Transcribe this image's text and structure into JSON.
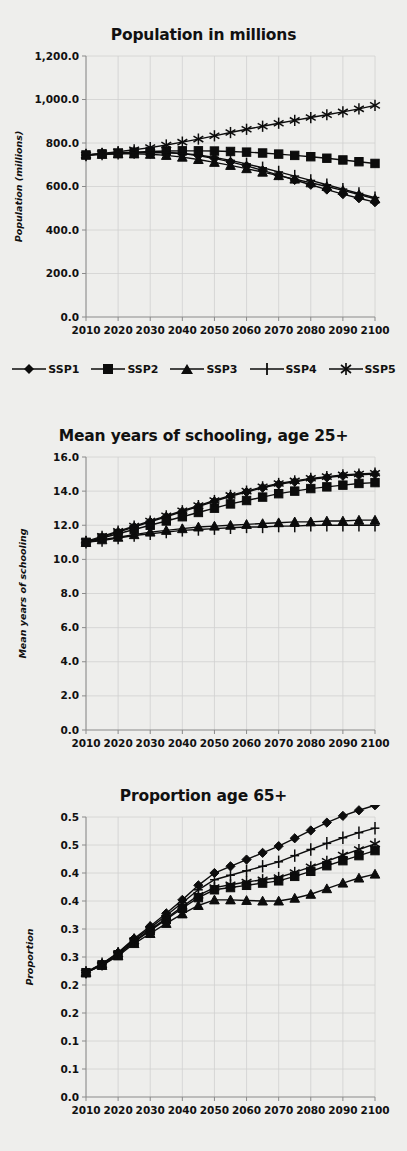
{
  "figure": {
    "panels": [
      "population",
      "schooling",
      "proportion"
    ],
    "legend": {
      "position": "below-first-panel",
      "items": [
        {
          "label": "SSP1",
          "marker": "diamond-marker-icon"
        },
        {
          "label": "SSP2",
          "marker": "square-marker-icon"
        },
        {
          "label": "SSP3",
          "marker": "triangle-marker-icon"
        },
        {
          "label": "SSP4",
          "marker": "plus-marker-icon"
        },
        {
          "label": "SSP5",
          "marker": "asterisk-marker-icon"
        }
      ]
    }
  },
  "chart_data": [
    {
      "id": "population",
      "type": "line",
      "title": "Population in millions",
      "xlabel": "",
      "ylabel": "Population (millions)",
      "grid": true,
      "legend_position": "bottom",
      "xlim": [
        2010,
        2100
      ],
      "ylim": [
        0,
        1200
      ],
      "yticks": [
        0,
        200,
        400,
        600,
        800,
        1000,
        1200
      ],
      "ytick_labels": [
        "0.0",
        "200.0",
        "400.0",
        "600.0",
        "800.0",
        "1,000.0",
        "1,200.0"
      ],
      "xticks": [
        2010,
        2020,
        2030,
        2040,
        2050,
        2060,
        2070,
        2080,
        2090,
        2100
      ],
      "xtick_labels": [
        "2010",
        "2020",
        "2030",
        "2040",
        "2050",
        "2060",
        "2070",
        "2080",
        "2090",
        "2100"
      ],
      "x": [
        2010,
        2015,
        2020,
        2025,
        2030,
        2035,
        2040,
        2045,
        2050,
        2055,
        2060,
        2065,
        2070,
        2075,
        2080,
        2085,
        2090,
        2095,
        2100
      ],
      "series": [
        {
          "name": "SSP1",
          "marker": "diamond",
          "values": [
            745,
            748,
            752,
            755,
            757,
            756,
            751,
            742,
            729,
            713,
            695,
            674,
            652,
            630,
            608,
            586,
            565,
            546,
            528
          ]
        },
        {
          "name": "SSP2",
          "marker": "square",
          "values": [
            745,
            750,
            754,
            758,
            761,
            763,
            764,
            764,
            763,
            761,
            758,
            754,
            749,
            743,
            737,
            730,
            722,
            714,
            706
          ]
        },
        {
          "name": "SSP3",
          "marker": "triangle",
          "values": [
            745,
            748,
            750,
            750,
            748,
            743,
            735,
            724,
            711,
            697,
            682,
            666,
            650,
            634,
            617,
            600,
            582,
            563,
            543
          ]
        },
        {
          "name": "SSP4",
          "marker": "plus",
          "values": [
            745,
            749,
            753,
            756,
            757,
            756,
            752,
            745,
            734,
            720,
            704,
            686,
            667,
            648,
            628,
            608,
            588,
            568,
            549
          ]
        },
        {
          "name": "SSP5",
          "marker": "asterisk",
          "values": [
            745,
            752,
            760,
            769,
            779,
            791,
            804,
            818,
            833,
            848,
            863,
            877,
            891,
            904,
            917,
            930,
            943,
            957,
            973
          ]
        }
      ]
    },
    {
      "id": "schooling",
      "type": "line",
      "title": "Mean years of schooling, age 25+",
      "xlabel": "",
      "ylabel": "Mean years of schooling",
      "grid": true,
      "legend_position": "shared",
      "xlim": [
        2010,
        2100
      ],
      "ylim": [
        0,
        16
      ],
      "yticks": [
        0,
        2,
        4,
        6,
        8,
        10,
        12,
        14,
        16
      ],
      "ytick_labels": [
        "0.0",
        "2.0",
        "4.0",
        "6.0",
        "8.0",
        "10.0",
        "12.0",
        "14.0",
        "16.0"
      ],
      "xticks": [
        2010,
        2020,
        2030,
        2040,
        2050,
        2060,
        2070,
        2080,
        2090,
        2100
      ],
      "xtick_labels": [
        "2010",
        "2020",
        "2030",
        "2040",
        "2050",
        "2060",
        "2070",
        "2080",
        "2090",
        "2100"
      ],
      "x": [
        2010,
        2015,
        2020,
        2025,
        2030,
        2035,
        2040,
        2045,
        2050,
        2055,
        2060,
        2065,
        2070,
        2075,
        2080,
        2085,
        2090,
        2095,
        2100
      ],
      "series": [
        {
          "name": "SSP1",
          "marker": "diamond",
          "values": [
            11.0,
            11.3,
            11.6,
            11.9,
            12.2,
            12.5,
            12.8,
            13.1,
            13.4,
            13.7,
            13.95,
            14.2,
            14.4,
            14.55,
            14.7,
            14.8,
            14.9,
            14.95,
            15.0
          ]
        },
        {
          "name": "SSP2",
          "marker": "square",
          "values": [
            11.0,
            11.25,
            11.5,
            11.75,
            12.0,
            12.25,
            12.5,
            12.75,
            13.0,
            13.25,
            13.45,
            13.65,
            13.85,
            14.0,
            14.15,
            14.25,
            14.35,
            14.45,
            14.5
          ]
        },
        {
          "name": "SSP3",
          "marker": "triangle",
          "values": [
            11.0,
            11.15,
            11.3,
            11.45,
            11.6,
            11.7,
            11.8,
            11.9,
            11.95,
            12.0,
            12.05,
            12.1,
            12.15,
            12.2,
            12.2,
            12.25,
            12.25,
            12.3,
            12.3
          ]
        },
        {
          "name": "SSP4",
          "marker": "plus",
          "values": [
            11.0,
            11.1,
            11.25,
            11.4,
            11.5,
            11.6,
            11.7,
            11.75,
            11.8,
            11.85,
            11.9,
            11.9,
            11.95,
            11.95,
            12.0,
            12.0,
            12.0,
            12.0,
            12.0
          ]
        },
        {
          "name": "SSP5",
          "marker": "asterisk",
          "values": [
            11.05,
            11.35,
            11.65,
            11.95,
            12.25,
            12.55,
            12.85,
            13.15,
            13.45,
            13.75,
            14.0,
            14.25,
            14.45,
            14.6,
            14.75,
            14.85,
            14.95,
            15.0,
            15.05
          ]
        }
      ]
    },
    {
      "id": "proportion",
      "type": "line",
      "title": "Proportion age 65+",
      "xlabel": "",
      "ylabel": "Proportion",
      "grid": true,
      "legend_position": "shared",
      "xlim": [
        2010,
        2100
      ],
      "ylim": [
        0,
        0.5
      ],
      "yticks": [
        0,
        0.05,
        0.1,
        0.15,
        0.2,
        0.25,
        0.3,
        0.35,
        0.4,
        0.45,
        0.5
      ],
      "ytick_labels": [
        "0.0",
        "0.1",
        "0.1",
        "0.2",
        "0.2",
        "0.3",
        "0.3",
        "0.4",
        "0.4",
        "0.5",
        "0.5"
      ],
      "xticks": [
        2010,
        2020,
        2030,
        2040,
        2050,
        2060,
        2070,
        2080,
        2090,
        2100
      ],
      "xtick_labels": [
        "2010",
        "2020",
        "2030",
        "2040",
        "2050",
        "2060",
        "2070",
        "2080",
        "2090",
        "2100"
      ],
      "x": [
        2010,
        2015,
        2020,
        2025,
        2030,
        2035,
        2040,
        2045,
        2050,
        2055,
        2060,
        2065,
        2070,
        2075,
        2080,
        2085,
        2090,
        2095,
        2100
      ],
      "series": [
        {
          "name": "SSP1",
          "marker": "diamond",
          "values": [
            0.222,
            0.238,
            0.258,
            0.283,
            0.305,
            0.328,
            0.352,
            0.378,
            0.4,
            0.412,
            0.424,
            0.436,
            0.448,
            0.462,
            0.476,
            0.49,
            0.502,
            0.512,
            0.521
          ]
        },
        {
          "name": "SSP2",
          "marker": "square",
          "values": [
            0.222,
            0.236,
            0.254,
            0.277,
            0.297,
            0.317,
            0.337,
            0.356,
            0.37,
            0.374,
            0.378,
            0.382,
            0.386,
            0.394,
            0.403,
            0.413,
            0.422,
            0.431,
            0.44
          ]
        },
        {
          "name": "SSP3",
          "marker": "triangle",
          "values": [
            0.222,
            0.235,
            0.252,
            0.274,
            0.292,
            0.31,
            0.327,
            0.342,
            0.352,
            0.352,
            0.351,
            0.35,
            0.35,
            0.355,
            0.362,
            0.372,
            0.382,
            0.391,
            0.398
          ]
        },
        {
          "name": "SSP4",
          "marker": "plus",
          "values": [
            0.223,
            0.238,
            0.257,
            0.281,
            0.302,
            0.324,
            0.347,
            0.37,
            0.388,
            0.396,
            0.404,
            0.412,
            0.42,
            0.431,
            0.442,
            0.453,
            0.463,
            0.472,
            0.48
          ]
        },
        {
          "name": "SSP5",
          "marker": "asterisk",
          "values": [
            0.222,
            0.236,
            0.255,
            0.278,
            0.299,
            0.319,
            0.34,
            0.36,
            0.374,
            0.379,
            0.384,
            0.388,
            0.392,
            0.401,
            0.411,
            0.421,
            0.432,
            0.442,
            0.452
          ]
        }
      ]
    }
  ]
}
